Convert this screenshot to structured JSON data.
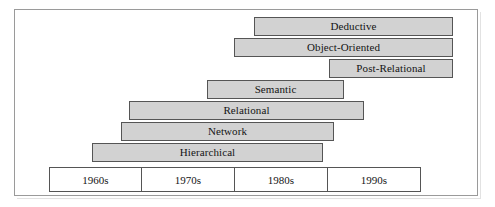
{
  "figure": {
    "background_color": "#ffffff",
    "frame_color": "#9a9a9a",
    "bar_fill_color": "#d2d2d2",
    "bar_border_color": "#555555",
    "text_color": "#141414"
  },
  "chart_data": {
    "type": "bar",
    "title": "",
    "subtitle": "",
    "xlabel": "",
    "ylabel": "",
    "orientation": "horizontal",
    "grid": false,
    "legend": false,
    "axis_type": "categorical-decades",
    "x_categories": [
      "1960s",
      "1970s",
      "1980s",
      "1990s"
    ],
    "xlim": [
      1960,
      2000
    ],
    "bars": [
      {
        "label": "Deductive",
        "row": 0,
        "start_decade": "1980s",
        "end_decade": "1990s",
        "start_year": 1982,
        "end_year": 2000,
        "px": {
          "left": 253,
          "right": 452,
          "top": 16,
          "height": 19
        }
      },
      {
        "label": "Object-Oriented",
        "row": 1,
        "start_decade": "1980s",
        "end_decade": "1990s",
        "start_year": 1980,
        "end_year": 2000,
        "px": {
          "left": 233,
          "right": 452,
          "top": 37,
          "height": 19
        }
      },
      {
        "label": "Post-Relational",
        "row": 2,
        "start_decade": "1990s",
        "end_decade": "1990s",
        "start_year": 1990,
        "end_year": 2000,
        "px": {
          "left": 328,
          "right": 452,
          "top": 58,
          "height": 19
        }
      },
      {
        "label": "Semantic",
        "row": 3,
        "start_decade": "1970s",
        "end_decade": "1980s",
        "start_year": 1977,
        "end_year": 1992,
        "px": {
          "left": 206,
          "right": 343,
          "top": 79,
          "height": 19
        }
      },
      {
        "label": "Relational",
        "row": 4,
        "start_decade": "1960s",
        "end_decade": "1990s",
        "start_year": 1969,
        "end_year": 1994,
        "px": {
          "left": 128,
          "right": 363,
          "top": 100,
          "height": 19
        }
      },
      {
        "label": "Network",
        "row": 5,
        "start_decade": "1960s",
        "end_decade": "1980s",
        "start_year": 1968,
        "end_year": 1991,
        "px": {
          "left": 120,
          "right": 333,
          "top": 121,
          "height": 19
        }
      },
      {
        "label": "Hierarchical",
        "row": 6,
        "start_decade": "1960s",
        "end_decade": "1980s",
        "start_year": 1964,
        "end_year": 1989,
        "px": {
          "left": 91,
          "right": 322,
          "top": 142,
          "height": 19
        }
      }
    ],
    "axis": {
      "px": {
        "left": 48,
        "right": 420,
        "top": 166,
        "height": 25
      },
      "cells": [
        {
          "label": "1960s"
        },
        {
          "label": "1970s"
        },
        {
          "label": "1980s"
        },
        {
          "label": "1990s"
        }
      ]
    }
  }
}
